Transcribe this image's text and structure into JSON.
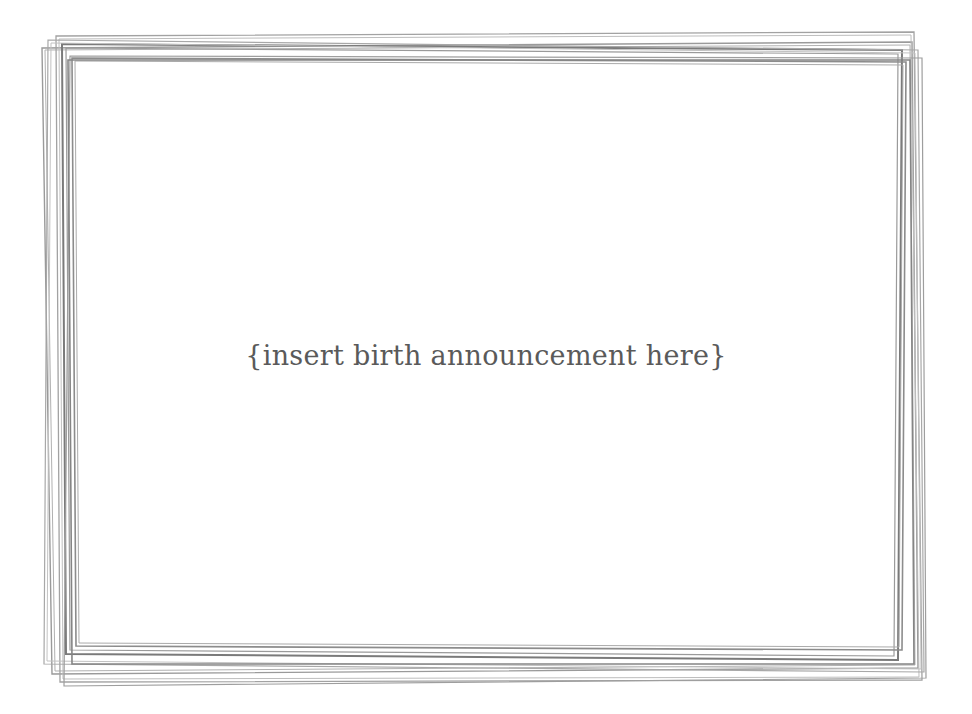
{
  "card": {
    "message": "{insert birth announcement here}",
    "text_color": "#5a5a5a",
    "frame_color": "#8a8a8a",
    "background": "#ffffff"
  }
}
